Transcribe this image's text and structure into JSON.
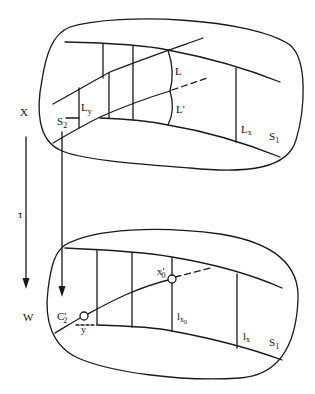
{
  "diagram": {
    "type": "mapping-diagram",
    "stroke_color": "#1a1a1a",
    "background": "#ffffff",
    "top_region": {
      "name": "X",
      "labels": {
        "space": "X",
        "L": "L",
        "L_prime": "L'",
        "L_y": "L",
        "L_y_sub": "y",
        "L_x": "L",
        "L_x_sub": "x",
        "S2": "S",
        "S2_sub": "2",
        "S1": "S",
        "S1_sub": "1"
      }
    },
    "map": {
      "label": "τ"
    },
    "bottom_region": {
      "name": "W",
      "labels": {
        "space": "W",
        "C2_prime": "C'",
        "C2_sub": "2",
        "y": "y",
        "x0_prime": "x'",
        "x0_sub": "0",
        "l_x0": "l",
        "l_x0_sub": "x",
        "l_x0_subsub": "0",
        "l_x": "l",
        "l_x_sub": "x",
        "S1": "S",
        "S1_sub": "1"
      }
    }
  }
}
